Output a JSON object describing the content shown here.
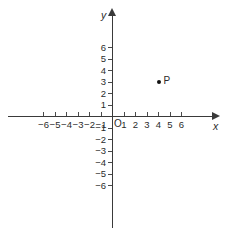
{
  "graph": {
    "background_color": "#ffffff",
    "axis_color": "#3a3a3a",
    "text_color": "#2b2b2b",
    "point_color": "#111111",
    "axis_labels": {
      "x": "x",
      "y": "y"
    },
    "origin_label": "O",
    "x_ticks": [
      {
        "value": -6,
        "label": "−6"
      },
      {
        "value": -5,
        "label": "−5"
      },
      {
        "value": -4,
        "label": "−4"
      },
      {
        "value": -3,
        "label": "−3"
      },
      {
        "value": -2,
        "label": "−2"
      },
      {
        "value": -1,
        "label": "−1"
      },
      {
        "value": 1,
        "label": "1"
      },
      {
        "value": 2,
        "label": "2"
      },
      {
        "value": 3,
        "label": "3"
      },
      {
        "value": 4,
        "label": "4"
      },
      {
        "value": 5,
        "label": "5"
      },
      {
        "value": 6,
        "label": "6"
      }
    ],
    "y_ticks": [
      {
        "value": 6,
        "label": "6"
      },
      {
        "value": 5,
        "label": "5"
      },
      {
        "value": 4,
        "label": "4"
      },
      {
        "value": 3,
        "label": "3"
      },
      {
        "value": 2,
        "label": "2"
      },
      {
        "value": 1,
        "label": "1"
      },
      {
        "value": -1,
        "label": "−1"
      },
      {
        "value": -2,
        "label": "−2"
      },
      {
        "value": -3,
        "label": "−3"
      },
      {
        "value": -4,
        "label": "−4"
      },
      {
        "value": -5,
        "label": "−5"
      },
      {
        "value": -6,
        "label": "−6"
      }
    ],
    "points": [
      {
        "label": "P",
        "x": 4,
        "y": 3
      }
    ]
  },
  "chart_data": {
    "type": "scatter",
    "title": "",
    "xlabel": "x",
    "ylabel": "y",
    "xlim": [
      -6.5,
      6.5
    ],
    "ylim": [
      -6.5,
      6.5
    ],
    "xticks": [
      -6,
      -5,
      -4,
      -3,
      -2,
      -1,
      1,
      2,
      3,
      4,
      5,
      6
    ],
    "yticks": [
      6,
      5,
      4,
      3,
      2,
      1,
      -1,
      -2,
      -3,
      -4,
      -5,
      -6
    ],
    "grid": false,
    "legend": "none",
    "series": [
      {
        "name": "P",
        "x": [
          4
        ],
        "y": [
          3
        ],
        "labels": [
          "P"
        ]
      }
    ],
    "annotations": [
      {
        "text": "P",
        "x": 4,
        "y": 3,
        "position": "right"
      },
      {
        "text": "O",
        "x": 0,
        "y": 0,
        "position": "lower-right"
      }
    ]
  }
}
